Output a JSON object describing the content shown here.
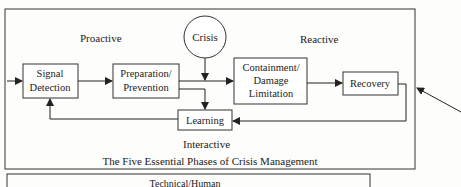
{
  "diagram": {
    "title": "The Five Essential Phases of Crisis Management",
    "regions": {
      "proactive": "Proactive",
      "reactive": "Reactive",
      "interactive": "Interactive"
    },
    "nodes": {
      "crisis": "Crisis",
      "signal_detection": [
        "Signal",
        "Detection"
      ],
      "preparation": [
        "Preparation/",
        "Prevention"
      ],
      "containment": [
        "Containment/",
        "Damage",
        "Limitation"
      ],
      "recovery": "Recovery",
      "learning": "Learning"
    },
    "bottom_box_partial_text": "Technical/Human"
  }
}
